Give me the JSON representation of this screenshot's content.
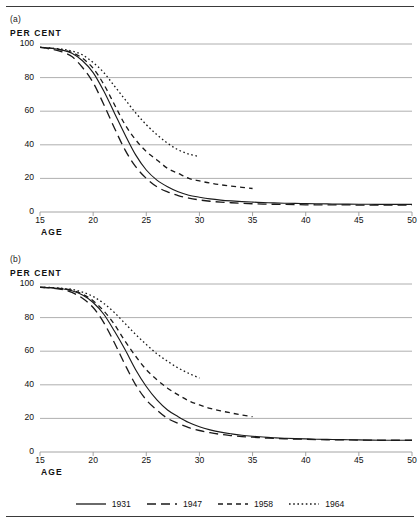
{
  "figure": {
    "panel_a_letter": "(a)",
    "panel_b_letter": "(b)",
    "y_axis_title": "PER CENT",
    "x_axis_title": "AGE"
  },
  "legend": {
    "position": "bottom-center",
    "items": [
      {
        "label": "1931",
        "style": "solid",
        "dash": "none",
        "color": "#1a1a1a"
      },
      {
        "label": "1947",
        "style": "long-dash",
        "dash": "9,5",
        "color": "#1a1a1a"
      },
      {
        "label": "1958",
        "style": "dash",
        "dash": "5,4",
        "color": "#1a1a1a"
      },
      {
        "label": "1964",
        "style": "dotted",
        "dash": "1.6,2.6",
        "color": "#1a1a1a"
      }
    ]
  },
  "axes": {
    "x_ticks": [
      15,
      20,
      25,
      30,
      35,
      40,
      45,
      50
    ],
    "y_ticks": [
      0,
      20,
      40,
      60,
      80,
      100
    ],
    "xlim": [
      15,
      50
    ],
    "ylim": [
      0,
      100
    ],
    "grid": "horizontal"
  },
  "chart_data": [
    {
      "type": "line",
      "panel": "(a)",
      "title": "",
      "xlabel": "AGE",
      "ylabel": "PER CENT",
      "xlim": [
        15,
        50
      ],
      "ylim": [
        0,
        100
      ],
      "grid": "horizontal",
      "legend_position": "bottom-center",
      "x": [
        15,
        16,
        17,
        18,
        19,
        20,
        21,
        22,
        23,
        24,
        25,
        26,
        27,
        28,
        29,
        30,
        31,
        32,
        33,
        34,
        35,
        36,
        37,
        38,
        39,
        40,
        41,
        42,
        43,
        44,
        45,
        46,
        47,
        48,
        49,
        50
      ],
      "series": [
        {
          "name": "1931",
          "style": "solid",
          "values": [
            98,
            97.5,
            96.5,
            94.5,
            90,
            83,
            72,
            59,
            46,
            34,
            25,
            19,
            15,
            12,
            10,
            8.8,
            7.8,
            7.1,
            6.6,
            6.2,
            5.9,
            5.6,
            5.4,
            5.2,
            5.1,
            5.0,
            4.9,
            4.8,
            4.7,
            4.7,
            4.6,
            4.6,
            4.5,
            4.5,
            4.5,
            4.5
          ]
        },
        {
          "name": "1947",
          "style": "long-dash",
          "values": [
            98,
            97,
            95.5,
            92.5,
            86,
            77,
            64,
            50,
            37,
            27,
            20,
            15,
            12,
            9.8,
            8.3,
            7.2,
            6.4,
            5.9,
            5.5,
            5.2,
            4.9,
            4.7,
            4.6,
            4.5,
            4.4,
            4.3,
            4.3,
            4.2,
            4.2,
            4.2,
            4.1,
            4.1,
            4.1,
            4.1,
            4.1,
            4.1
          ]
        },
        {
          "name": "1958",
          "style": "dash",
          "values": [
            98,
            97.5,
            96.5,
            95,
            91.5,
            85.5,
            76,
            64,
            52,
            43,
            36,
            31,
            26,
            23,
            20,
            18.5,
            17.2,
            16.2,
            15.4,
            14.7,
            14.0,
            null,
            null,
            null,
            null,
            null,
            null,
            null,
            null,
            null,
            null,
            null,
            null,
            null,
            null,
            null
          ],
          "truncated_at_age": 35,
          "end_value": 14
        },
        {
          "name": "1964",
          "style": "dotted",
          "values": [
            98,
            97.6,
            97,
            95.8,
            93.5,
            89,
            83,
            75,
            67,
            59,
            52,
            46,
            41,
            37,
            34.5,
            33,
            null,
            null,
            null,
            null,
            null,
            null,
            null,
            null,
            null,
            null,
            null,
            null,
            null,
            null,
            null,
            null,
            null,
            null,
            null,
            null
          ],
          "truncated_at_age": 30,
          "end_value": 33
        }
      ]
    },
    {
      "type": "line",
      "panel": "(b)",
      "title": "",
      "xlabel": "AGE",
      "ylabel": "PER CENT",
      "xlim": [
        15,
        50
      ],
      "ylim": [
        0,
        100
      ],
      "grid": "horizontal",
      "legend_position": "bottom-center",
      "x": [
        15,
        16,
        17,
        18,
        19,
        20,
        21,
        22,
        23,
        24,
        25,
        26,
        27,
        28,
        29,
        30,
        31,
        32,
        33,
        34,
        35,
        36,
        37,
        38,
        39,
        40,
        41,
        42,
        43,
        44,
        45,
        46,
        47,
        48,
        49,
        50
      ],
      "series": [
        {
          "name": "1931",
          "style": "solid",
          "values": [
            98,
            97.8,
            97.2,
            96,
            93.5,
            89,
            82,
            72,
            61,
            49,
            39,
            31,
            25,
            21,
            17.5,
            15,
            13.2,
            11.8,
            10.8,
            10.0,
            9.4,
            8.9,
            8.5,
            8.2,
            8.0,
            7.8,
            7.6,
            7.5,
            7.4,
            7.3,
            7.2,
            7.1,
            7.0,
            7.0,
            7.0,
            7.0
          ]
        },
        {
          "name": "1947",
          "style": "long-dash",
          "values": [
            98,
            97.6,
            96.8,
            95,
            91.5,
            86,
            77,
            65,
            52,
            40,
            31,
            25,
            20,
            17,
            14.5,
            12.8,
            11.5,
            10.5,
            9.8,
            9.2,
            8.8,
            8.4,
            8.1,
            7.9,
            7.7,
            7.6,
            7.4,
            7.3,
            7.2,
            7.2,
            7.1,
            7.1,
            7.0,
            7.0,
            7.0,
            7.0
          ]
        },
        {
          "name": "1958",
          "style": "dash",
          "values": [
            98,
            97.8,
            97.3,
            96.3,
            94,
            90,
            84,
            76,
            66,
            57,
            49,
            43,
            38,
            34,
            30.5,
            28,
            26,
            24.5,
            23.2,
            22.0,
            21.0,
            null,
            null,
            null,
            null,
            null,
            null,
            null,
            null,
            null,
            null,
            null,
            null,
            null,
            null,
            null
          ],
          "truncated_at_age": 35,
          "end_value": 21
        },
        {
          "name": "1964",
          "style": "dotted",
          "values": [
            98,
            97.9,
            97.5,
            96.8,
            95.2,
            92.5,
            88.5,
            83,
            76.5,
            70,
            64,
            58.5,
            54,
            50,
            46.8,
            44,
            null,
            null,
            null,
            null,
            null,
            null,
            null,
            null,
            null,
            null,
            null,
            null,
            null,
            null,
            null,
            null,
            null,
            null,
            null,
            null
          ],
          "truncated_at_age": 30,
          "end_value": 44
        }
      ]
    }
  ]
}
